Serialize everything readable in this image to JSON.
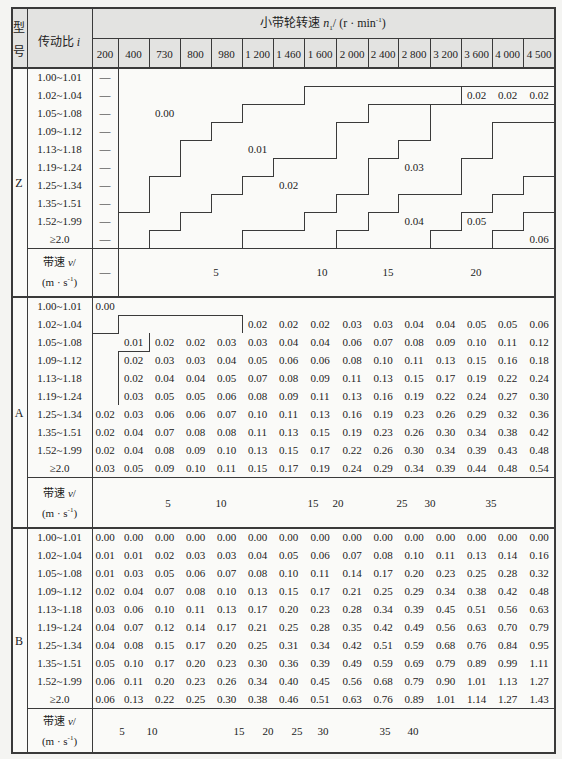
{
  "header": {
    "type_label_top": "型",
    "type_label_bottom": "号",
    "ratio_label": "传动比",
    "ratio_symbol": "i",
    "speed_title": "小带轮转速",
    "speed_symbol": "n",
    "speed_sub": "1",
    "speed_unit_pre": "/ (r · min",
    "speed_unit_exp": "-1",
    "speed_unit_post": ")",
    "rpm_columns": [
      "200",
      "400",
      "730",
      "800",
      "980",
      "1 200",
      "1 460",
      "1 600",
      "2 000",
      "2 400",
      "2 800",
      "3 200",
      "3 600",
      "4 000",
      "4 500"
    ]
  },
  "belt_speed_label": {
    "text": "带速",
    "symbol": "v",
    "slash": "/",
    "unit_pre": "(m · s",
    "unit_exp": "-1",
    "unit_post": ")"
  },
  "sections": [
    {
      "type": "Z",
      "rows": [
        {
          "ratio": "1.00~1.01",
          "values": [
            "—",
            null,
            null,
            null,
            null,
            null,
            null,
            null,
            null,
            null,
            null,
            null,
            null,
            null,
            null
          ]
        },
        {
          "ratio": "1.02~1.04",
          "values": [
            "—",
            null,
            null,
            null,
            null,
            null,
            null,
            null,
            null,
            null,
            null,
            null,
            "0.02",
            "0.02",
            "0.02"
          ]
        },
        {
          "ratio": "1.05~1.08",
          "values": [
            "—",
            null,
            null,
            null,
            null,
            null,
            null,
            null,
            null,
            null,
            null,
            null,
            null,
            null,
            null
          ]
        },
        {
          "ratio": "1.09~1.12",
          "values": [
            "—",
            null,
            null,
            null,
            null,
            null,
            null,
            null,
            null,
            null,
            null,
            null,
            null,
            null,
            null
          ]
        },
        {
          "ratio": "1.13~1.18",
          "values": [
            "—",
            null,
            null,
            null,
            null,
            null,
            null,
            null,
            null,
            null,
            null,
            null,
            null,
            null,
            null
          ]
        },
        {
          "ratio": "1.19~1.24",
          "values": [
            "—",
            null,
            null,
            null,
            null,
            null,
            null,
            null,
            null,
            null,
            null,
            null,
            null,
            null,
            null
          ]
        },
        {
          "ratio": "1.25~1.34",
          "values": [
            "—",
            null,
            null,
            null,
            null,
            null,
            null,
            null,
            null,
            null,
            null,
            null,
            null,
            null,
            null
          ]
        },
        {
          "ratio": "1.35~1.51",
          "values": [
            "—",
            null,
            null,
            null,
            null,
            null,
            null,
            null,
            null,
            null,
            null,
            null,
            null,
            null,
            null
          ]
        },
        {
          "ratio": "1.52~1.99",
          "values": [
            "—",
            null,
            null,
            null,
            null,
            null,
            null,
            null,
            null,
            null,
            null,
            null,
            null,
            null,
            null
          ]
        },
        {
          "ratio": "≥2.0",
          "values": [
            "—",
            null,
            null,
            null,
            null,
            null,
            null,
            null,
            null,
            null,
            null,
            null,
            null,
            null,
            null
          ]
        }
      ],
      "region_labels": [
        {
          "value": "0.00",
          "row": 2,
          "col": 2
        },
        {
          "value": "0.01",
          "row": 4,
          "col": 5
        },
        {
          "value": "0.02",
          "row": 6,
          "col": 6
        },
        {
          "value": "0.03",
          "row": 5,
          "col": 10
        },
        {
          "value": "0.04",
          "row": 8,
          "col": 10
        },
        {
          "value": "0.05",
          "row": 8,
          "col": 12
        },
        {
          "value": "0.06",
          "row": 9,
          "col": 14
        }
      ],
      "speed_markers": [
        {
          "label": "—",
          "x": 105
        },
        {
          "label": "5",
          "x": 216
        },
        {
          "label": "10",
          "x": 322
        },
        {
          "label": "15",
          "x": 388
        },
        {
          "label": "20",
          "x": 476
        }
      ]
    },
    {
      "type": "A",
      "rows": [
        {
          "ratio": "1.00~1.01",
          "values": [
            "0.00",
            null,
            null,
            null,
            null,
            null,
            null,
            null,
            null,
            null,
            null,
            null,
            null,
            null,
            null
          ]
        },
        {
          "ratio": "1.02~1.04",
          "values": [
            null,
            null,
            null,
            null,
            null,
            "0.02",
            "0.02",
            "0.02",
            "0.03",
            "0.03",
            "0.04",
            "0.04",
            "0.05",
            "0.05",
            "0.06"
          ]
        },
        {
          "ratio": "1.05~1.08",
          "values": [
            null,
            "0.01",
            "0.02",
            "0.02",
            "0.03",
            "0.03",
            "0.04",
            "0.04",
            "0.06",
            "0.07",
            "0.08",
            "0.09",
            "0.10",
            "0.11",
            "0.12"
          ]
        },
        {
          "ratio": "1.09~1.12",
          "values": [
            null,
            "0.02",
            "0.03",
            "0.03",
            "0.04",
            "0.05",
            "0.06",
            "0.06",
            "0.08",
            "0.10",
            "0.11",
            "0.13",
            "0.15",
            "0.16",
            "0.18"
          ]
        },
        {
          "ratio": "1.13~1.18",
          "values": [
            null,
            "0.02",
            "0.04",
            "0.04",
            "0.05",
            "0.07",
            "0.08",
            "0.09",
            "0.11",
            "0.13",
            "0.15",
            "0.17",
            "0.19",
            "0.22",
            "0.24"
          ]
        },
        {
          "ratio": "1.19~1.24",
          "values": [
            null,
            "0.03",
            "0.05",
            "0.05",
            "0.06",
            "0.08",
            "0.09",
            "0.11",
            "0.13",
            "0.16",
            "0.19",
            "0.22",
            "0.24",
            "0.27",
            "0.30"
          ]
        },
        {
          "ratio": "1.25~1.34",
          "values": [
            "0.02",
            "0.03",
            "0.06",
            "0.06",
            "0.07",
            "0.10",
            "0.11",
            "0.13",
            "0.16",
            "0.19",
            "0.23",
            "0.26",
            "0.29",
            "0.32",
            "0.36"
          ]
        },
        {
          "ratio": "1.35~1.51",
          "values": [
            "0.02",
            "0.04",
            "0.07",
            "0.08",
            "0.08",
            "0.11",
            "0.13",
            "0.15",
            "0.19",
            "0.23",
            "0.26",
            "0.30",
            "0.34",
            "0.38",
            "0.42"
          ]
        },
        {
          "ratio": "1.52~1.99",
          "values": [
            "0.02",
            "0.04",
            "0.08",
            "0.09",
            "0.10",
            "0.13",
            "0.15",
            "0.17",
            "0.22",
            "0.26",
            "0.30",
            "0.34",
            "0.39",
            "0.43",
            "0.48"
          ]
        },
        {
          "ratio": "≥2.0",
          "values": [
            "0.03",
            "0.05",
            "0.09",
            "0.10",
            "0.11",
            "0.15",
            "0.17",
            "0.19",
            "0.24",
            "0.29",
            "0.34",
            "0.39",
            "0.44",
            "0.48",
            "0.54"
          ]
        }
      ],
      "region_labels": [],
      "speed_markers": [
        {
          "label": "5",
          "x": 168
        },
        {
          "label": "10",
          "x": 221
        },
        {
          "label": "15",
          "x": 313
        },
        {
          "label": "20",
          "x": 338
        },
        {
          "label": "25",
          "x": 402
        },
        {
          "label": "30",
          "x": 430
        },
        {
          "label": "35",
          "x": 491
        }
      ]
    },
    {
      "type": "B",
      "rows": [
        {
          "ratio": "1.00~1.01",
          "values": [
            "0.00",
            "0.00",
            "0.00",
            "0.00",
            "0.00",
            "0.00",
            "0.00",
            "0.00",
            "0.00",
            "0.00",
            "0.00",
            "0.00",
            "0.00",
            "0.00",
            "0.00"
          ]
        },
        {
          "ratio": "1.02~1.04",
          "values": [
            "0.01",
            "0.01",
            "0.02",
            "0.03",
            "0.03",
            "0.04",
            "0.05",
            "0.06",
            "0.07",
            "0.08",
            "0.10",
            "0.11",
            "0.13",
            "0.14",
            "0.16"
          ]
        },
        {
          "ratio": "1.05~1.08",
          "values": [
            "0.01",
            "0.03",
            "0.05",
            "0.06",
            "0.07",
            "0.08",
            "0.10",
            "0.11",
            "0.14",
            "0.17",
            "0.20",
            "0.23",
            "0.25",
            "0.28",
            "0.32"
          ]
        },
        {
          "ratio": "1.09~1.12",
          "values": [
            "0.02",
            "0.04",
            "0.07",
            "0.08",
            "0.10",
            "0.13",
            "0.15",
            "0.17",
            "0.21",
            "0.25",
            "0.29",
            "0.34",
            "0.38",
            "0.42",
            "0.48"
          ]
        },
        {
          "ratio": "1.13~1.18",
          "values": [
            "0.03",
            "0.06",
            "0.10",
            "0.11",
            "0.13",
            "0.17",
            "0.20",
            "0.23",
            "0.28",
            "0.34",
            "0.39",
            "0.45",
            "0.51",
            "0.56",
            "0.63"
          ]
        },
        {
          "ratio": "1.19~1.24",
          "values": [
            "0.04",
            "0.07",
            "0.12",
            "0.14",
            "0.17",
            "0.21",
            "0.25",
            "0.28",
            "0.35",
            "0.42",
            "0.49",
            "0.56",
            "0.63",
            "0.70",
            "0.79"
          ]
        },
        {
          "ratio": "1.25~1.34",
          "values": [
            "0.04",
            "0.08",
            "0.15",
            "0.17",
            "0.20",
            "0.25",
            "0.31",
            "0.34",
            "0.42",
            "0.51",
            "0.59",
            "0.68",
            "0.76",
            "0.84",
            "0.95"
          ]
        },
        {
          "ratio": "1.35~1.51",
          "values": [
            "0.05",
            "0.10",
            "0.17",
            "0.20",
            "0.23",
            "0.30",
            "0.36",
            "0.39",
            "0.49",
            "0.59",
            "0.69",
            "0.79",
            "0.89",
            "0.99",
            "1.11"
          ]
        },
        {
          "ratio": "1.52~1.99",
          "values": [
            "0.06",
            "0.11",
            "0.20",
            "0.23",
            "0.26",
            "0.34",
            "0.40",
            "0.45",
            "0.56",
            "0.68",
            "0.79",
            "0.90",
            "1.01",
            "1.13",
            "1.27"
          ]
        },
        {
          "ratio": "≥2.0",
          "values": [
            "0.06",
            "0.13",
            "0.22",
            "0.25",
            "0.30",
            "0.38",
            "0.46",
            "0.51",
            "0.63",
            "0.76",
            "0.89",
            "1.01",
            "1.14",
            "1.27",
            "1.43"
          ]
        }
      ],
      "region_labels": [],
      "speed_markers": [
        {
          "label": "5",
          "x": 122
        },
        {
          "label": "10",
          "x": 152
        },
        {
          "label": "15",
          "x": 239
        },
        {
          "label": "20",
          "x": 268
        },
        {
          "label": "25",
          "x": 297
        },
        {
          "label": "30",
          "x": 323
        },
        {
          "label": "35",
          "x": 385
        },
        {
          "label": "40",
          "x": 413
        }
      ]
    }
  ]
}
